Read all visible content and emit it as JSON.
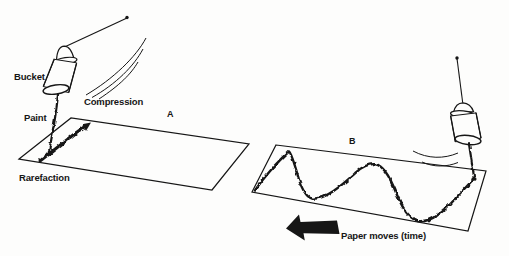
{
  "figure": {
    "background": "#fdfdfc",
    "ink": "#161616",
    "labels": {
      "bucket": "Bucket",
      "compression": "Compression",
      "paint": "Paint",
      "rarefaction": "Rarefaction",
      "panel_a": "A",
      "panel_b": "B",
      "paper_moves": "Paper moves (time)"
    }
  }
}
